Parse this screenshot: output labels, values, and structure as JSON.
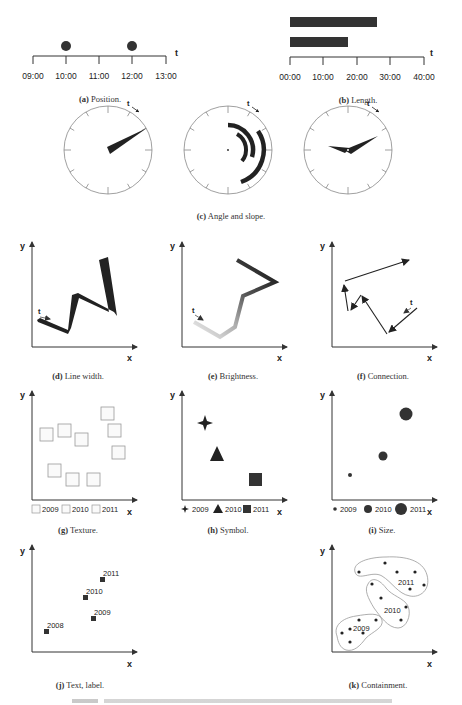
{
  "panels": {
    "a": {
      "letter": "(a)",
      "caption": "Position.",
      "axis_label": "t",
      "ticks": [
        "09:00",
        "10:00",
        "11:00",
        "12:00",
        "13:00"
      ],
      "points": [
        "10:00",
        "12:00"
      ]
    },
    "b": {
      "letter": "(b)",
      "caption": "Length.",
      "axis_label": "t",
      "ticks": [
        "00:00",
        "10:00",
        "20:00",
        "30:00",
        "40:00"
      ],
      "bars_minutes": [
        26,
        17
      ]
    },
    "c": {
      "letter": "(c)",
      "caption": "Angle and slope.",
      "clock_label": "t"
    },
    "d": {
      "letter": "(d)",
      "caption": "Line width.",
      "x_label": "x",
      "y_label": "y",
      "t_label": "t"
    },
    "e": {
      "letter": "(e)",
      "caption": "Brightness.",
      "x_label": "x",
      "y_label": "y",
      "t_label": "t"
    },
    "f": {
      "letter": "(f)",
      "caption": "Connection.",
      "x_label": "x",
      "y_label": "y",
      "t_label": "t"
    },
    "g": {
      "letter": "(g)",
      "caption": "Texture.",
      "x_label": "x",
      "y_label": "y",
      "legend": [
        "2009",
        "2010",
        "2011"
      ]
    },
    "h": {
      "letter": "(h)",
      "caption": "Symbol.",
      "x_label": "x",
      "y_label": "y",
      "legend": [
        "2009",
        "2010",
        "2011"
      ]
    },
    "i": {
      "letter": "(i)",
      "caption": "Size.",
      "x_label": "x",
      "y_label": "y",
      "legend": [
        "2009",
        "2010",
        "2011"
      ]
    },
    "j": {
      "letter": "(j)",
      "caption": "Text, label.",
      "x_label": "x",
      "y_label": "y",
      "labels": [
        "2008",
        "2009",
        "2010",
        "2011"
      ]
    },
    "k": {
      "letter": "(k)",
      "caption": "Containment.",
      "x_label": "x",
      "y_label": "y",
      "groups": [
        "2009",
        "2010",
        "2011"
      ]
    }
  }
}
